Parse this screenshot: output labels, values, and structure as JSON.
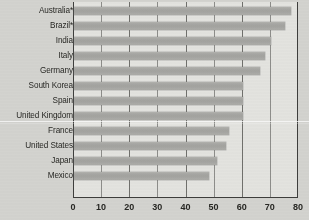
{
  "chart_data": {
    "type": "bar",
    "orientation": "horizontal",
    "title": "",
    "subtitle": "",
    "xlabel": "",
    "ylabel": "",
    "xlim": [
      0,
      80
    ],
    "xticks": [
      0,
      10,
      20,
      30,
      40,
      50,
      60,
      70,
      80
    ],
    "grid": true,
    "legend": null,
    "categories": [
      "Australia*",
      "Brazil*",
      "India",
      "Italy",
      "Germany",
      "South Korea",
      "Spain",
      "United Kingdom",
      "France",
      "United States",
      "Japan",
      "Mexico"
    ],
    "values": [
      77,
      75,
      70,
      68,
      66,
      60,
      60,
      60,
      55,
      54,
      51,
      48
    ],
    "series": [
      {
        "name": "",
        "values": [
          77,
          75,
          70,
          68,
          66,
          60,
          60,
          60,
          55,
          54,
          51,
          48
        ]
      }
    ]
  },
  "style": {
    "bar_color": "#a8a8a4",
    "plot_background": "#e7e7e3",
    "page_background": "#d6d6d2",
    "axis_color": "#3a3a38",
    "gridline_color": "#6e6e6a",
    "text_color": "#23231f"
  }
}
